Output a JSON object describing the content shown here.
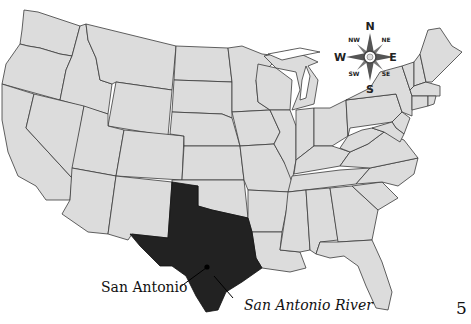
{
  "map": {
    "title": "United States map with Texas highlighted",
    "highlighted_region": "Texas",
    "colors": {
      "land": "#dcdcdc",
      "border": "#3a3a3a",
      "highlight": "#222222",
      "water": "#ffffff"
    }
  },
  "labels": {
    "city": "San Antonio",
    "river": "San Antonio River"
  },
  "compass": {
    "icon": "compass-rose-icon",
    "n": "N",
    "ne": "NE",
    "e": "E",
    "se": "SE",
    "s": "S",
    "sw": "SW",
    "w": "W",
    "nw": "NW"
  },
  "page": {
    "number": "5"
  }
}
